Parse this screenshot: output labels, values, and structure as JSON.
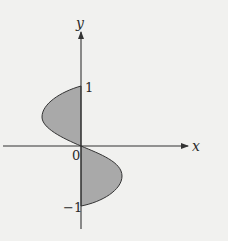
{
  "figure": {
    "axes": {
      "x_label": "x",
      "y_label": "y",
      "origin_label": "0",
      "y_tick_top": "1",
      "y_tick_bottom": "−1"
    },
    "colors": {
      "background": "#f1f1ef",
      "fill": "#a9a9a9",
      "stroke": "#333333"
    },
    "regions": [
      {
        "name": "upper-left-lobe",
        "y_range": [
          0,
          1
        ],
        "side": "left"
      },
      {
        "name": "lower-right-lobe",
        "y_range": [
          -1,
          0
        ],
        "side": "right"
      }
    ]
  }
}
